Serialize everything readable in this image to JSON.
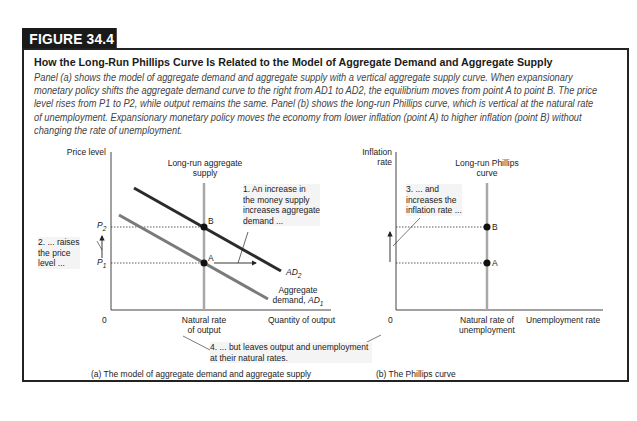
{
  "figure": {
    "tag": "FIGURE 34.4",
    "title": "How the Long-Run Phillips Curve Is Related to the Model of Aggregate Demand and Aggregate Supply",
    "caption": "Panel (a) shows the model of aggregate demand and aggregate supply with a vertical aggregate supply curve. When expansionary monetary policy shifts the aggregate demand curve to the right from AD1 to AD2, the equilibrium moves from point A to point B. The price level rises from P1 to P2, while output remains the same. Panel (b) shows the long-run Phillips curve, which is vertical at the natural rate of unemployment. Expansionary monetary policy moves the economy from lower inflation (point A) to higher inflation (point B) without changing the rate of unemployment."
  },
  "panel_a": {
    "y_axis_label": "Price level",
    "x_axis_label": "Quantity of output",
    "origin": "0",
    "lras_label_1": "Long-run aggregate",
    "lras_label_2": "supply",
    "natural_rate_1": "Natural rate",
    "natural_rate_2": "of output",
    "p2": "P",
    "p2_sub": "2",
    "p1": "P",
    "p1_sub": "1",
    "point_b": "B",
    "point_a": "A",
    "ad2": "AD",
    "ad2_sub": "2",
    "ad1_line1": "Aggregate",
    "ad1_line2": "demand, ",
    "ad1": "AD",
    "ad1_sub": "1",
    "note1_l1": "1. An increase in",
    "note1_l2": "the money supply",
    "note1_l3": "increases aggregate",
    "note1_l4": "demand ...",
    "note2_l1": "2. ... raises",
    "note2_l2": "the price",
    "note2_l3": "level ...",
    "caption": "(a) The model of aggregate demand and aggregate supply"
  },
  "panel_b": {
    "y_axis_label_1": "Inflation",
    "y_axis_label_2": "rate",
    "x_axis_label": "Unemployment rate",
    "origin": "0",
    "lrpc_label_1": "Long-run Phillips",
    "lrpc_label_2": "curve",
    "natural_rate_1": "Natural rate of",
    "natural_rate_2": "unemployment",
    "point_b": "B",
    "point_a": "A",
    "note3_l1": "3. ... and",
    "note3_l2": "increases the",
    "note3_l3": "inflation rate ...",
    "caption": "(b) The Phillips curve"
  },
  "shared_note": {
    "l1": "4. ... but leaves output and unemployment",
    "l2": "at their natural rates."
  },
  "colors": {
    "ad2": "#2b2b2b",
    "ad1": "#7a7a7a",
    "vertical_curve": "#a8a8a8",
    "axis": "#333333"
  }
}
